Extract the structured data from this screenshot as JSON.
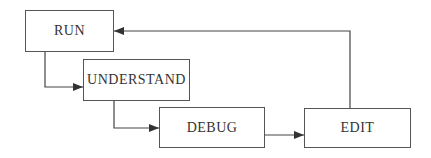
{
  "diagram": {
    "type": "flowchart",
    "nodes": [
      {
        "id": "run",
        "label": "RUN"
      },
      {
        "id": "understand",
        "label": "UNDERSTAND"
      },
      {
        "id": "debug",
        "label": "DEBUG"
      },
      {
        "id": "edit",
        "label": "EDIT"
      }
    ],
    "edges": [
      {
        "from": "run",
        "to": "understand"
      },
      {
        "from": "understand",
        "to": "debug"
      },
      {
        "from": "debug",
        "to": "edit"
      },
      {
        "from": "edit",
        "to": "run"
      }
    ],
    "colors": {
      "line": "#444444",
      "border": "#555555",
      "text": "#333333",
      "background": "#ffffff"
    }
  }
}
